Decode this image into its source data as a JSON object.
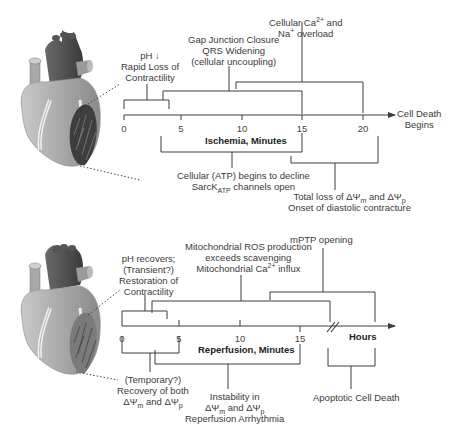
{
  "ischemia": {
    "axis_label": "Ischemia, Minutes",
    "end_label_1": "Cell Death",
    "end_label_2": "Begins",
    "ticks": [
      "0",
      "5",
      "10",
      "15",
      "20"
    ],
    "above": [
      {
        "lines": [
          "pH ↓",
          "Rapid Loss of",
          "Contractility"
        ]
      },
      {
        "lines": [
          "Gap Junction Closure",
          "QRS Widening",
          "(cellular uncoupling)"
        ]
      },
      {
        "line1_pre": "Cellular Ca",
        "line1_sup": "2+",
        "line1_post": " and",
        "line2_pre": "Na",
        "line2_sup": "+",
        "line2_post": " overload"
      }
    ],
    "below": [
      {
        "line1": "Cellular (ATP) begins to decline",
        "line2_pre": "SarcK",
        "line2_sub": "ATP",
        "line2_post": " channels open"
      },
      {
        "line1_pre": "Total loss of ΔΨ",
        "line1_sub1": "m",
        "line1_mid": " and ΔΨ",
        "line1_sub2": "p",
        "line2": "Onset of diastolic contracture"
      }
    ]
  },
  "reperfusion": {
    "axis_label": "Reperfusion, Minutes",
    "hours_label": "Hours",
    "ticks": [
      "0",
      "5",
      "10",
      "15"
    ],
    "above": [
      {
        "lines": [
          "pH recovers;",
          "(Transient?)",
          "Restoration of",
          "Contractility"
        ]
      },
      {
        "line1": "Mitochondrial ROS production",
        "line2": "exceeds scavenging",
        "line3_pre": "Mitochondrial Ca",
        "line3_sup": "2+",
        "line3_post": " influx"
      },
      {
        "lines": [
          "mPTP opening"
        ]
      }
    ],
    "below": [
      {
        "line1": "(Temporary?)",
        "line2": "Recovery of both",
        "line3_pre": "ΔΨ",
        "line3_sub1": "m",
        "line3_mid": " and ΔΨ",
        "line3_sub2": "p"
      },
      {
        "line1": "Instability in",
        "line2_pre": "ΔΨ",
        "line2_sub1": "m",
        "line2_mid": " and ΔΨ",
        "line2_sub2": "p",
        "line3": "Reperfusion Arrhythmia"
      },
      {
        "lines": [
          "Apoptotic Cell Death"
        ]
      }
    ]
  },
  "colors": {
    "line": "#3c3c3c",
    "heart_light": "#b8b8b8",
    "heart_dark": "#4a4a4a"
  }
}
